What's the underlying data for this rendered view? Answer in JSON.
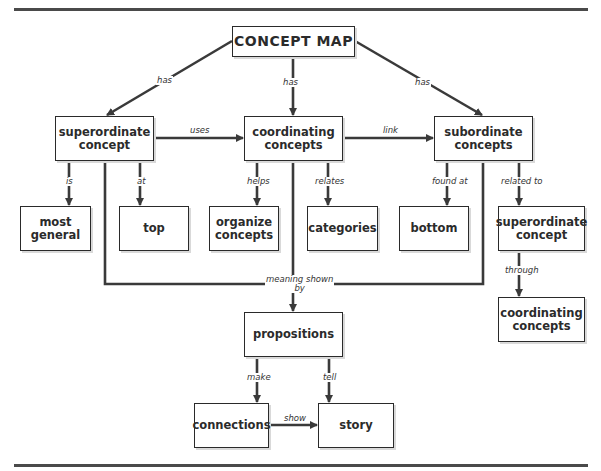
{
  "diagram": {
    "title": "CONCEPT MAP",
    "nodes": {
      "root": "CONCEPT MAP",
      "superordinate": "superordinate\nconcept",
      "coordinating": "coordinating\nconcepts",
      "subordinate": "subordinate\nconcepts",
      "most_general": "most\ngeneral",
      "top": "top",
      "organize": "organize\nconcepts",
      "categories": "categories",
      "bottom": "bottom",
      "superordinate_right": "superordinate\nconcept",
      "coordinating_right": "coordinating\nconcepts",
      "propositions": "propositions",
      "connections": "connections",
      "story": "story"
    },
    "links": {
      "has_left": "has",
      "has_center": "has",
      "has_right": "has",
      "uses": "uses",
      "link": "link",
      "is": "is",
      "at": "at",
      "helps": "helps",
      "relates": "relates",
      "found_at": "found at",
      "related_to": "related to",
      "through": "through",
      "meaning_shown_by": "meaning shown\nby",
      "make": "make",
      "tell": "tell",
      "show": "show"
    },
    "colors": {
      "line": "#3a3a3a",
      "border": "#2a2a2a",
      "text": "#2b2b2b"
    }
  }
}
